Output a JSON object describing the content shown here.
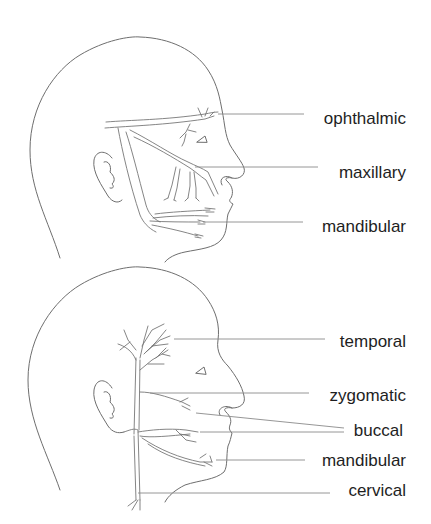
{
  "figures": [
    {
      "id": "trigeminal",
      "labels": [
        {
          "text": "ophthalmic",
          "x": 406,
          "y": 124,
          "line": [
            218,
            114,
            304,
            114
          ]
        },
        {
          "text": "maxillary",
          "x": 406,
          "y": 178,
          "line": [
            195,
            167,
            318,
            167
          ]
        },
        {
          "text": "mandibular",
          "x": 406,
          "y": 232,
          "line": [
            203,
            222,
            303,
            222
          ]
        }
      ]
    },
    {
      "id": "facial",
      "labels": [
        {
          "text": "temporal",
          "x": 406,
          "y": 347,
          "line": [
            174,
            339,
            325,
            339
          ]
        },
        {
          "text": "zygomatic",
          "x": 406,
          "y": 401,
          "line": [
            150,
            393,
            309,
            393
          ]
        },
        {
          "text": "buccal",
          "x": 403,
          "y": 436,
          "line": [
            196,
            413,
            344,
            428
          ],
          "line2": [
            200,
            432,
            344,
            432
          ]
        },
        {
          "text": "mandibular",
          "x": 406,
          "y": 466,
          "line": [
            216,
            460,
            305,
            460
          ]
        },
        {
          "text": "cervical",
          "x": 406,
          "y": 496,
          "line": [
            138,
            493,
            330,
            493
          ]
        }
      ]
    }
  ],
  "colors": {
    "stroke": "#6e6e6e",
    "text": "#1e1e1e",
    "background": "#ffffff"
  }
}
